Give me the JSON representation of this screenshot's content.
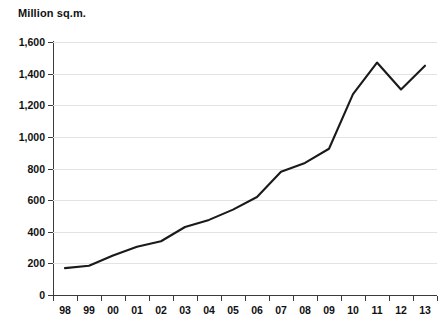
{
  "chart_data": {
    "type": "line",
    "title": "Million sq.m.",
    "xlabel": "",
    "ylabel": "Million sq.m.",
    "categories": [
      "98",
      "99",
      "00",
      "01",
      "02",
      "03",
      "04",
      "05",
      "06",
      "07",
      "08",
      "09",
      "10",
      "11",
      "12",
      "13"
    ],
    "x": [
      1998,
      1999,
      2000,
      2001,
      2002,
      2003,
      2004,
      2005,
      2006,
      2007,
      2008,
      2009,
      2010,
      2011,
      2012,
      2013
    ],
    "series": [
      {
        "name": "Million sq.m.",
        "values": [
          170,
          185,
          250,
          305,
          340,
          430,
          475,
          540,
          620,
          780,
          835,
          925,
          1270,
          1470,
          1300,
          1450
        ],
        "color": "#1a1a1a"
      }
    ],
    "ylim": [
      0,
      1600
    ],
    "y_ticks": [
      0,
      200,
      400,
      600,
      800,
      1000,
      1200,
      1400,
      1600
    ],
    "y_tick_labels": [
      "0",
      "200",
      "400",
      "600",
      "800",
      "1,000",
      "1,200",
      "1,400",
      "1,600"
    ],
    "grid": true,
    "grid_axis": "y",
    "legend": false,
    "legend_position": "none"
  },
  "colors": {
    "line": "#1a1a1a",
    "gridline": "#e3e3e3",
    "axis": "#3a3a3a",
    "text": "#111111",
    "background": "#ffffff"
  }
}
